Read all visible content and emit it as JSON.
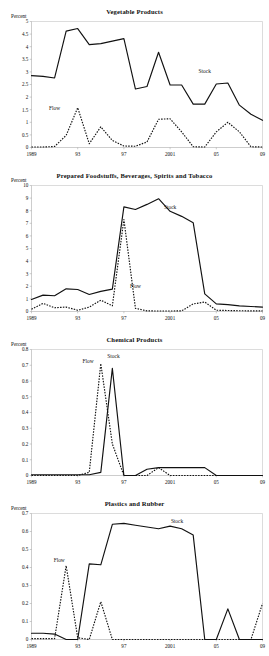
{
  "page": {
    "axis_caption": "Percent",
    "series_names": {
      "stock": "Stock",
      "flow": "Flow"
    }
  },
  "charts": [
    {
      "id": "vegetable-products",
      "title": "Vegetable Products",
      "axis_caption": "Percent",
      "stock_label": "Stock",
      "flow_label": "Flow"
    },
    {
      "id": "prepared-foodstuffs",
      "title": "Prepared Foodstuffs, Beverages, Spirits and Tobacco",
      "axis_caption": "Percent",
      "stock_label": "Stock",
      "flow_label": "Flow"
    },
    {
      "id": "chemical-products",
      "title": "Chemical Products",
      "axis_caption": "Percent",
      "stock_label": "Stock",
      "flow_label": "Flow"
    },
    {
      "id": "plastics-and-rubber",
      "title": "Plastics and Rubber",
      "axis_caption": "Percent",
      "stock_label": "Stock",
      "flow_label": "Flow"
    }
  ],
  "chart_data": [
    {
      "type": "line",
      "title": "Vegetable Products",
      "xlabel": "",
      "ylabel": "Percent",
      "ylim": [
        0,
        5
      ],
      "yticks": [
        0,
        0.5,
        1,
        1.5,
        2,
        2.5,
        3,
        3.5,
        4,
        4.5,
        5
      ],
      "ytick_labels": [
        "0",
        "0.5",
        "1",
        "1.5",
        "2",
        "2.5",
        "3",
        "3.5",
        "4",
        "4.5",
        "5"
      ],
      "xlim": [
        1989,
        2009
      ],
      "xticks": [
        1989,
        1993,
        1997,
        2001,
        2005,
        2009
      ],
      "xtick_labels": [
        "1989",
        "93",
        "97",
        "2001",
        "05",
        "09"
      ],
      "grid": false,
      "legend": "inline-annotations",
      "x": [
        1989,
        1990,
        1991,
        1992,
        1993,
        1994,
        1995,
        1996,
        1997,
        1998,
        1999,
        2000,
        2001,
        2002,
        2003,
        2004,
        2005,
        2006,
        2007,
        2008,
        2009
      ],
      "series": [
        {
          "name": "Stock",
          "style": "solid",
          "values": [
            2.85,
            2.82,
            2.76,
            4.62,
            4.72,
            4.08,
            4.12,
            4.22,
            4.32,
            2.32,
            2.42,
            3.78,
            2.48,
            2.48,
            1.72,
            1.72,
            2.52,
            2.56,
            1.68,
            1.32,
            1.08
          ]
        },
        {
          "name": "Flow",
          "style": "dashed",
          "values": [
            0.02,
            0.02,
            0.04,
            0.48,
            1.58,
            0.15,
            0.82,
            0.28,
            0.06,
            0.05,
            0.22,
            1.12,
            1.14,
            0.62,
            0.03,
            0.02,
            0.62,
            1.0,
            0.62,
            0.03,
            0.02
          ]
        }
      ]
    },
    {
      "type": "line",
      "title": "Prepared Foodstuffs, Beverages, Spirits and Tobacco",
      "xlabel": "",
      "ylabel": "Percent",
      "ylim": [
        0,
        10
      ],
      "yticks": [
        0,
        1,
        2,
        3,
        4,
        5,
        6,
        7,
        8,
        9,
        10
      ],
      "ytick_labels": [
        "0",
        "1",
        "2",
        "3",
        "4",
        "5",
        "6",
        "7",
        "8",
        "9",
        "10"
      ],
      "xlim": [
        1989,
        2009
      ],
      "xticks": [
        1989,
        1993,
        1997,
        2001,
        2005,
        2009
      ],
      "xtick_labels": [
        "1989",
        "93",
        "97",
        "2001",
        "05",
        "09"
      ],
      "grid": false,
      "legend": "inline-annotations",
      "x": [
        1989,
        1990,
        1991,
        1992,
        1993,
        1994,
        1995,
        1996,
        1997,
        1998,
        1999,
        2000,
        2001,
        2002,
        2003,
        2004,
        2005,
        2006,
        2007,
        2008,
        2009
      ],
      "series": [
        {
          "name": "Stock",
          "style": "solid",
          "values": [
            0.95,
            1.3,
            1.25,
            1.8,
            1.75,
            1.35,
            1.6,
            1.78,
            8.3,
            8.1,
            8.5,
            8.95,
            7.95,
            7.55,
            7.05,
            1.4,
            0.6,
            0.55,
            0.45,
            0.4,
            0.35
          ]
        },
        {
          "name": "Flow",
          "style": "dashed",
          "values": [
            0.18,
            0.65,
            0.3,
            0.35,
            0.1,
            0.35,
            0.9,
            0.45,
            7.3,
            0.25,
            0.05,
            0.04,
            0.04,
            0.05,
            0.6,
            0.75,
            0.1,
            0.08,
            0.06,
            0.05,
            0.05
          ]
        }
      ]
    },
    {
      "type": "line",
      "title": "Chemical Products",
      "xlabel": "",
      "ylabel": "Percent",
      "ylim": [
        0,
        0.8
      ],
      "yticks": [
        0,
        0.1,
        0.2,
        0.3,
        0.4,
        0.5,
        0.6,
        0.7,
        0.8
      ],
      "ytick_labels": [
        "0",
        "0.1",
        "0.2",
        "0.3",
        "0.4",
        "0.5",
        "0.6",
        "0.7",
        "0.8"
      ],
      "xlim": [
        1989,
        2009
      ],
      "xticks": [
        1989,
        1993,
        1997,
        2001,
        2005,
        2009
      ],
      "xtick_labels": [
        "1989",
        "93",
        "97",
        "2001",
        "05",
        "09"
      ],
      "grid": false,
      "legend": "inline-annotations",
      "x": [
        1989,
        1990,
        1991,
        1992,
        1993,
        1994,
        1995,
        1996,
        1997,
        1998,
        1999,
        2000,
        2001,
        2002,
        2003,
        2004,
        2005,
        2006,
        2007,
        2008,
        2009
      ],
      "series": [
        {
          "name": "Stock",
          "style": "solid",
          "values": [
            0.005,
            0.005,
            0.005,
            0.005,
            0.005,
            0.005,
            0.02,
            0.68,
            0.0,
            0.0,
            0.04,
            0.05,
            0.05,
            0.05,
            0.05,
            0.05,
            0.0,
            0.0,
            0.0,
            0.0,
            0.0
          ]
        },
        {
          "name": "Flow",
          "style": "dashed",
          "values": [
            0.0,
            0.0,
            0.0,
            0.0,
            0.0,
            0.02,
            0.71,
            0.2,
            0.0,
            0.0,
            0.0,
            0.05,
            0.0,
            0.0,
            0.0,
            0.0,
            0.0,
            0.0,
            0.0,
            0.0,
            0.0
          ]
        }
      ]
    },
    {
      "type": "line",
      "title": "Plastics and Rubber",
      "xlabel": "",
      "ylabel": "Percent",
      "ylim": [
        0,
        0.7
      ],
      "yticks": [
        0,
        0.1,
        0.2,
        0.3,
        0.4,
        0.5,
        0.6,
        0.7
      ],
      "ytick_labels": [
        "0",
        "0.1",
        "0.2",
        "0.3",
        "0.4",
        "0.5",
        "0.6",
        "0.7"
      ],
      "xlim": [
        1989,
        2009
      ],
      "xticks": [
        1989,
        1993,
        1997,
        2001,
        2005,
        2009
      ],
      "xtick_labels": [
        "1989",
        "93",
        "97",
        "2001",
        "05",
        "09"
      ],
      "grid": false,
      "legend": "inline-annotations",
      "x": [
        1989,
        1990,
        1991,
        1992,
        1993,
        1994,
        1995,
        1996,
        1997,
        1998,
        1999,
        2000,
        2001,
        2002,
        2003,
        2004,
        2005,
        2006,
        2007,
        2008,
        2009
      ],
      "series": [
        {
          "name": "Stock",
          "style": "solid",
          "values": [
            0.035,
            0.035,
            0.03,
            0.0,
            0.0,
            0.42,
            0.415,
            0.64,
            0.645,
            0.635,
            0.625,
            0.615,
            0.63,
            0.615,
            0.58,
            0.0,
            0.0,
            0.17,
            0.0,
            0.0,
            0.0
          ]
        },
        {
          "name": "Flow",
          "style": "dashed",
          "values": [
            0.005,
            0.005,
            0.005,
            0.41,
            0.01,
            0.0,
            0.21,
            0.0,
            0.0,
            0.0,
            0.0,
            0.0,
            0.0,
            0.0,
            0.0,
            0.0,
            0.0,
            0.0,
            0.0,
            0.0,
            0.2
          ]
        }
      ]
    }
  ]
}
